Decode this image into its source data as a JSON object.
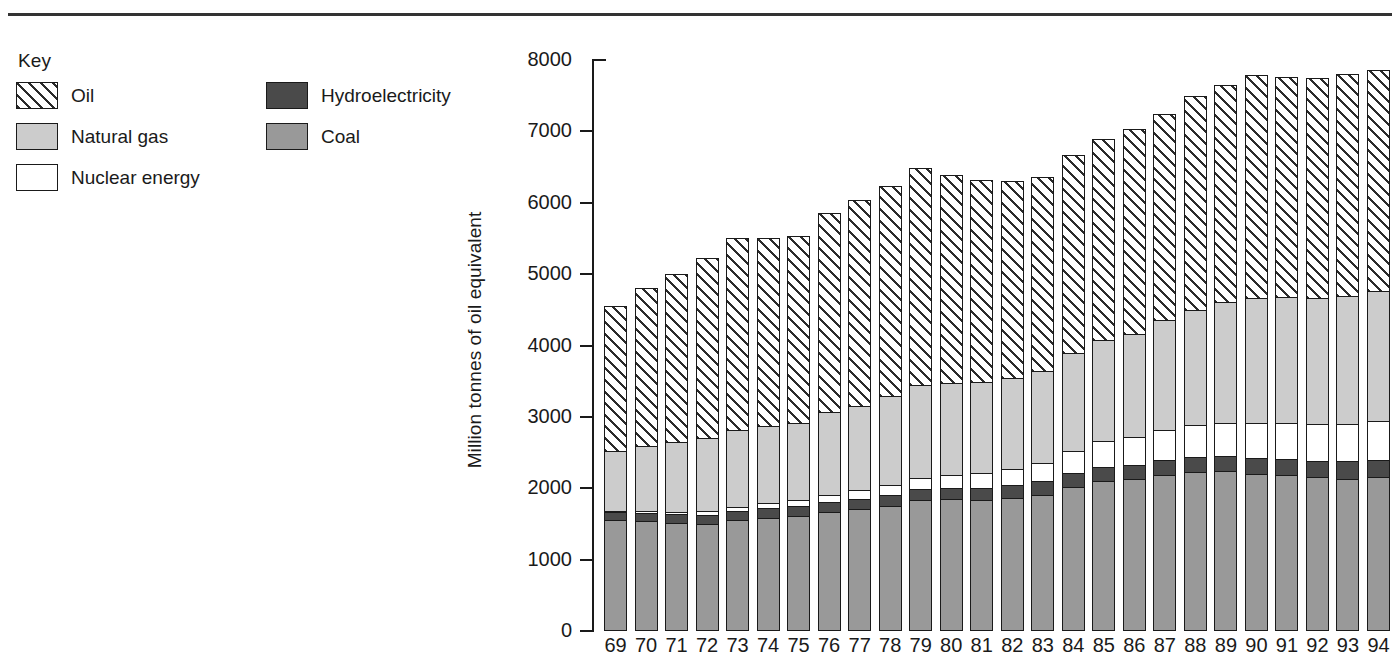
{
  "page": {
    "divider": "horizontal-rule"
  },
  "legend": {
    "title": "Key",
    "columns": [
      [
        {
          "label": "Oil",
          "swatch": "hatched-diagonal",
          "color": "#ffffff"
        },
        {
          "label": "Natural gas",
          "swatch": "solid",
          "color": "#cccccc"
        },
        {
          "label": "Nuclear energy",
          "swatch": "solid",
          "color": "#ffffff"
        }
      ],
      [
        {
          "label": "Hydroelectricity",
          "swatch": "solid",
          "color": "#4a4a4a"
        },
        {
          "label": "Coal",
          "swatch": "solid",
          "color": "#999999"
        }
      ]
    ]
  },
  "chart_data": {
    "type": "bar",
    "subtype": "stacked-vertical",
    "title": "",
    "xlabel": "",
    "ylabel": "Million tonnes of oil equivalent",
    "ylim": [
      0,
      8000
    ],
    "yticks": [
      0,
      1000,
      2000,
      3000,
      4000,
      5000,
      6000,
      7000,
      8000
    ],
    "ytick_labels": [
      "0",
      "1000",
      "2000",
      "3000",
      "4000",
      "5000",
      "6000",
      "7000",
      "8000"
    ],
    "grid": false,
    "legend_position": "top-left",
    "categories": [
      "69",
      "70",
      "71",
      "72",
      "73",
      "74",
      "75",
      "76",
      "77",
      "78",
      "79",
      "80",
      "81",
      "82",
      "83",
      "84",
      "85",
      "86",
      "87",
      "88",
      "89",
      "90",
      "91",
      "92",
      "93",
      "94"
    ],
    "stack_order_bottom_to_top": [
      "Coal",
      "Hydroelectricity",
      "Nuclear energy",
      "Natural gas",
      "Oil"
    ],
    "series": [
      {
        "name": "Coal",
        "color": "#999999",
        "values": [
          1550,
          1530,
          1510,
          1500,
          1550,
          1580,
          1600,
          1660,
          1700,
          1740,
          1830,
          1840,
          1830,
          1860,
          1900,
          2010,
          2090,
          2120,
          2180,
          2220,
          2230,
          2200,
          2180,
          2150,
          2130,
          2150
        ]
      },
      {
        "name": "Hydroelectricity",
        "color": "#4a4a4a",
        "values": [
          110,
          115,
          120,
          125,
          125,
          135,
          140,
          140,
          145,
          155,
          160,
          165,
          170,
          180,
          190,
          195,
          200,
          205,
          210,
          215,
          215,
          225,
          230,
          230,
          240,
          245
        ]
      },
      {
        "name": "Nuclear energy",
        "color": "#ffffff",
        "values": [
          20,
          25,
          35,
          45,
          55,
          70,
          90,
          105,
          125,
          145,
          155,
          175,
          205,
          230,
          265,
          320,
          375,
          395,
          425,
          455,
          470,
          490,
          500,
          510,
          530,
          540
        ]
      },
      {
        "name": "Natural gas",
        "color": "#cccccc",
        "values": [
          850,
          920,
          980,
          1030,
          1090,
          1090,
          1080,
          1160,
          1180,
          1250,
          1300,
          1300,
          1280,
          1280,
          1290,
          1370,
          1420,
          1440,
          1540,
          1610,
          1700,
          1760,
          1770,
          1780,
          1800,
          1830
        ]
      },
      {
        "name": "Oil",
        "color": "#ffffff",
        "pattern": "diagonal-hatch",
        "values": [
          2030,
          2220,
          2350,
          2520,
          2680,
          2630,
          2620,
          2790,
          2890,
          2950,
          3040,
          2910,
          2830,
          2760,
          2720,
          2780,
          2810,
          2870,
          2890,
          3000,
          3030,
          3110,
          3080,
          3080,
          3100,
          3100
        ]
      }
    ],
    "totals": [
      4560,
      4810,
      4995,
      5220,
      5500,
      5505,
      5530,
      5855,
      6040,
      6240,
      6485,
      6390,
      6315,
      6310,
      6365,
      6675,
      6895,
      7030,
      7245,
      7500,
      7645,
      7785,
      7760,
      7750,
      7800,
      7865
    ]
  }
}
